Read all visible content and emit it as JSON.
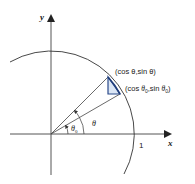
{
  "diagram": {
    "axes": {
      "x_label": "x",
      "y_label": "y",
      "unit_tick_label": "1"
    },
    "points": {
      "theta_point_label": "(cos θ,sin θ)",
      "theta0_point_label_parts": [
        "(cos ",
        "θ",
        "0",
        ",sin ",
        "θ",
        "0",
        ")"
      ]
    },
    "angles": {
      "theta_label": "θ",
      "theta0_label": "θ",
      "theta0_subscript": "0"
    },
    "colors": {
      "axis": "#555555",
      "circle": "#333333",
      "triangle": "#2b4a8a",
      "triangle_fill": "#dbe6f5",
      "arc_highlight": "#1f3d7a"
    }
  }
}
